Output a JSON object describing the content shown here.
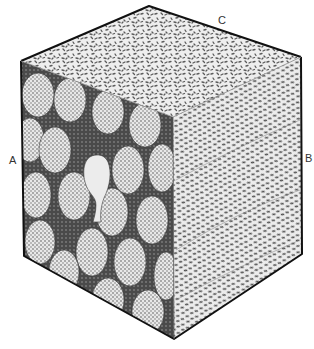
{
  "figure": {
    "type": "cube block diagram",
    "background": "#ffffff",
    "edge_color": "#111111",
    "faces": {
      "top": {
        "plane": "C",
        "texture": "dense randomly oriented short dashes"
      },
      "left": {
        "plane": "A",
        "texture": "ovoid cell-like bodies with stippled interiors on dark matrix, one pale teardrop body"
      },
      "right": {
        "plane": "B",
        "texture": "wavy aligned dashes in layered bands"
      }
    },
    "colors": {
      "dash": "#555555",
      "matrix": "#4a4a4a",
      "cell_fill": "#e6e6e6",
      "cell_dot": "#5a5a5a",
      "pale_body": "#ececec",
      "face_bg": "#eeeeee"
    }
  },
  "labels": {
    "a": "A",
    "b": "B",
    "c": "C"
  }
}
